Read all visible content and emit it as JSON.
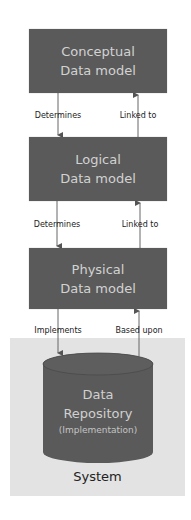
{
  "diagram": {
    "colors": {
      "box_fill": "#5a5a5a",
      "box_text": "#d2d2d2",
      "system_fill": "#e3e3e3",
      "arrow": "#555555",
      "label_text": "#222222"
    },
    "models": [
      {
        "line1": "Conceptual",
        "line2": "Data model"
      },
      {
        "line1": "Logical",
        "line2": "Data model"
      },
      {
        "line1": "Physical",
        "line2": "Data model"
      }
    ],
    "connectors": [
      {
        "down_label": "Determines",
        "up_label": "Linked to"
      },
      {
        "down_label": "Determines",
        "up_label": "Linked to"
      },
      {
        "down_label": "Implements",
        "up_label": "Based upon"
      }
    ],
    "repository": {
      "line1": "Data",
      "line2": "Repository",
      "line3": "(Implementation)",
      "shape": "cylinder"
    },
    "system": {
      "label": "System"
    }
  }
}
